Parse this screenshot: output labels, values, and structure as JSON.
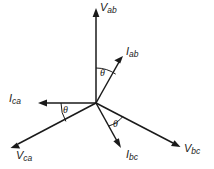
{
  "diagram": {
    "type": "phasor-vector-diagram",
    "origin": {
      "x": 96,
      "y": 103
    },
    "stroke_color": "#1a1a1a",
    "background_color": "#ffffff",
    "angle_symbol": "θ",
    "vectors": [
      {
        "id": "v-ab",
        "label_main": "V",
        "label_sub": "ab",
        "tip": {
          "x": 96,
          "y": 9
        },
        "label_pos": {
          "x": 100,
          "y": 3
        }
      },
      {
        "id": "i-ab",
        "label_main": "I",
        "label_sub": "ab",
        "tip": {
          "x": 123,
          "y": 57
        },
        "label_pos": {
          "x": 126,
          "y": 47
        }
      },
      {
        "id": "i-ca",
        "label_main": "I",
        "label_sub": "ca",
        "tip": {
          "x": 39,
          "y": 103
        },
        "label_pos": {
          "x": 9,
          "y": 94
        }
      },
      {
        "id": "v-ca",
        "label_main": "V",
        "label_sub": "ca",
        "tip": {
          "x": 11,
          "y": 148
        },
        "label_pos": {
          "x": 16,
          "y": 151
        }
      },
      {
        "id": "i-bc",
        "label_main": "I",
        "label_sub": "bc",
        "tip": {
          "x": 121,
          "y": 147
        },
        "label_pos": {
          "x": 126,
          "y": 150
        }
      },
      {
        "id": "v-bc",
        "label_main": "V",
        "label_sub": "bc",
        "tip": {
          "x": 180,
          "y": 147
        },
        "label_pos": {
          "x": 184,
          "y": 144
        }
      }
    ],
    "angle_markers": [
      {
        "id": "theta-vab-iab",
        "label": "θ",
        "between": [
          "v-ab",
          "i-ab"
        ],
        "label_pos": {
          "x": 100,
          "y": 69
        }
      },
      {
        "id": "theta-ica-vca",
        "label": "θ",
        "between": [
          "i-ca",
          "v-ca"
        ],
        "label_pos": {
          "x": 63,
          "y": 106
        }
      },
      {
        "id": "theta-ibc-vbc",
        "label": "θ",
        "between": [
          "i-bc",
          "v-bc"
        ],
        "label_pos": {
          "x": 113,
          "y": 120
        }
      }
    ]
  }
}
